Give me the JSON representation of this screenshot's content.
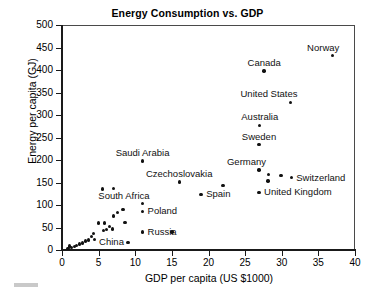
{
  "chart_data": {
    "type": "scatter",
    "title": "Energy Consumption vs. GDP",
    "xlabel": "GDP per capita (US $1000)",
    "ylabel": "Energy per capita (GJ)",
    "xlim": [
      0,
      40
    ],
    "ylim": [
      0,
      500
    ],
    "xticks": [
      0,
      5,
      10,
      15,
      20,
      25,
      30,
      35,
      40
    ],
    "yticks": [
      0,
      50,
      100,
      150,
      200,
      250,
      300,
      350,
      400,
      450,
      500
    ],
    "grid": false,
    "legend": "none",
    "marker_color": "#111111",
    "points": [
      {
        "label": "Norway",
        "x": 36.9,
        "y": 432,
        "label_pos": "above-right"
      },
      {
        "label": "Canada",
        "x": 27.6,
        "y": 398,
        "label_pos": "above"
      },
      {
        "label": "United States",
        "x": 31.2,
        "y": 328,
        "label_pos": "above-right"
      },
      {
        "label": "Australia",
        "x": 27.0,
        "y": 277,
        "label_pos": "above"
      },
      {
        "label": "Sweden",
        "x": 26.9,
        "y": 234,
        "label_pos": "above"
      },
      {
        "label": "Saudi Arabia",
        "x": 11.0,
        "y": 198,
        "label_pos": "above"
      },
      {
        "label": "Czechoslovakia",
        "x": 16.0,
        "y": 151,
        "label_pos": "above"
      },
      {
        "label": "Germany",
        "x": 26.9,
        "y": 178,
        "label_pos": "above-right"
      },
      {
        "label": "Switzerland",
        "x": 31.3,
        "y": 161,
        "label_pos": "right"
      },
      {
        "label": "United Kingdom",
        "x": 26.9,
        "y": 128,
        "label_pos": "right"
      },
      {
        "label": "Spain",
        "x": 19.0,
        "y": 124,
        "label_pos": "right"
      },
      {
        "label": "South Africa",
        "x": 11.0,
        "y": 103,
        "label_pos": "above-right"
      },
      {
        "label": "Poland",
        "x": 11.0,
        "y": 86,
        "label_pos": "right"
      },
      {
        "label": "China",
        "x": 9.0,
        "y": 17,
        "label_pos": "left"
      },
      {
        "label": "Russia",
        "x": 11.0,
        "y": 40,
        "label_pos": "right"
      },
      {
        "label": "",
        "x": 28.2,
        "y": 168,
        "label_pos": ""
      },
      {
        "label": "",
        "x": 29.9,
        "y": 166,
        "label_pos": ""
      },
      {
        "label": "",
        "x": 28.1,
        "y": 153,
        "label_pos": ""
      },
      {
        "label": "",
        "x": 22.0,
        "y": 143,
        "label_pos": ""
      },
      {
        "label": "",
        "x": 15.0,
        "y": 40,
        "label_pos": ""
      },
      {
        "label": "",
        "x": 5.5,
        "y": 136,
        "label_pos": ""
      },
      {
        "label": "",
        "x": 7.0,
        "y": 137,
        "label_pos": ""
      },
      {
        "label": "",
        "x": 8.3,
        "y": 90,
        "label_pos": ""
      },
      {
        "label": "",
        "x": 7.6,
        "y": 83,
        "label_pos": ""
      },
      {
        "label": "",
        "x": 7.0,
        "y": 76,
        "label_pos": ""
      },
      {
        "label": "",
        "x": 8.6,
        "y": 61,
        "label_pos": ""
      },
      {
        "label": "",
        "x": 6.5,
        "y": 52,
        "label_pos": ""
      },
      {
        "label": "",
        "x": 6.9,
        "y": 47,
        "label_pos": ""
      },
      {
        "label": "",
        "x": 6.1,
        "y": 45,
        "label_pos": ""
      },
      {
        "label": "",
        "x": 5.7,
        "y": 44,
        "label_pos": ""
      },
      {
        "label": "",
        "x": 5.0,
        "y": 60,
        "label_pos": ""
      },
      {
        "label": "",
        "x": 5.8,
        "y": 60,
        "label_pos": ""
      },
      {
        "label": "",
        "x": 4.3,
        "y": 37,
        "label_pos": ""
      },
      {
        "label": "",
        "x": 4.0,
        "y": 30,
        "label_pos": ""
      },
      {
        "label": "",
        "x": 4.4,
        "y": 24,
        "label_pos": ""
      },
      {
        "label": "",
        "x": 3.6,
        "y": 22,
        "label_pos": ""
      },
      {
        "label": "",
        "x": 3.2,
        "y": 20,
        "label_pos": ""
      },
      {
        "label": "",
        "x": 2.8,
        "y": 16,
        "label_pos": ""
      },
      {
        "label": "",
        "x": 2.4,
        "y": 13,
        "label_pos": ""
      },
      {
        "label": "",
        "x": 2.0,
        "y": 10,
        "label_pos": ""
      },
      {
        "label": "",
        "x": 1.7,
        "y": 8,
        "label_pos": ""
      },
      {
        "label": "",
        "x": 1.3,
        "y": 6,
        "label_pos": ""
      },
      {
        "label": "",
        "x": 1.0,
        "y": 9,
        "label_pos": ""
      },
      {
        "label": "",
        "x": 0.8,
        "y": 4,
        "label_pos": ""
      }
    ]
  }
}
